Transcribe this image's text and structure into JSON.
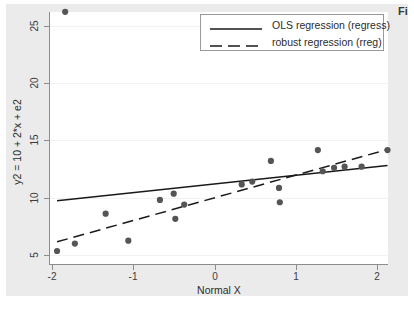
{
  "chart_data": {
    "type": "scatter",
    "title": "",
    "xlabel": "Normal X",
    "ylabel": "y2 = 10 + 2*x + e2",
    "xlim": [
      -2.15,
      2.25
    ],
    "ylim": [
      4.6,
      26.8
    ],
    "xticks": [
      -2,
      -1,
      0,
      1,
      2
    ],
    "xtick_labels": [
      "-2",
      "-1",
      "0",
      "1",
      "2"
    ],
    "yticks": [
      5,
      10,
      15,
      20,
      25
    ],
    "ytick_labels": [
      "5",
      "10",
      "15",
      "20",
      "25"
    ],
    "grid": "horizontal-faint",
    "legend_position": "top-right",
    "marker_color": "#555555",
    "line_color": "#1a1a1a",
    "points": [
      {
        "x": -1.85,
        "y": 26.2
      },
      {
        "x": -1.95,
        "y": 5.35
      },
      {
        "x": -1.73,
        "y": 6.0
      },
      {
        "x": -1.35,
        "y": 8.6
      },
      {
        "x": -1.07,
        "y": 6.25
      },
      {
        "x": -0.68,
        "y": 9.8
      },
      {
        "x": -0.51,
        "y": 10.35
      },
      {
        "x": -0.49,
        "y": 8.15
      },
      {
        "x": -0.38,
        "y": 9.4
      },
      {
        "x": 0.33,
        "y": 11.15
      },
      {
        "x": 0.46,
        "y": 11.4
      },
      {
        "x": 0.69,
        "y": 13.2
      },
      {
        "x": 0.79,
        "y": 10.85
      },
      {
        "x": 0.8,
        "y": 9.6
      },
      {
        "x": 1.27,
        "y": 14.15
      },
      {
        "x": 1.33,
        "y": 12.3
      },
      {
        "x": 1.47,
        "y": 12.6
      },
      {
        "x": 1.6,
        "y": 12.7
      },
      {
        "x": 1.81,
        "y": 12.7
      },
      {
        "x": 2.13,
        "y": 14.15
      }
    ],
    "series": [
      {
        "name": "OLS regression (regress)",
        "style": "solid",
        "x": [
          -1.95,
          2.13
        ],
        "y": [
          9.72,
          12.8
        ]
      },
      {
        "name": "robust regression (rreg)",
        "style": "dashed",
        "x": [
          -1.95,
          2.13
        ],
        "y": [
          6.15,
          14.2
        ]
      }
    ]
  },
  "legend": {
    "items": [
      {
        "label": "OLS regression (regress)",
        "style": "solid"
      },
      {
        "label": "robust regression (rreg)",
        "style": "dashed"
      }
    ]
  },
  "axes": {
    "x_label": "Normal X",
    "y_label": "y2 = 10 + 2*x + e2",
    "x_ticks": [
      "-2",
      "-1",
      "0",
      "1",
      "2"
    ],
    "y_ticks": [
      "5",
      "10",
      "15",
      "20",
      "25"
    ]
  },
  "annotations": {
    "corner_text": "Fi"
  }
}
